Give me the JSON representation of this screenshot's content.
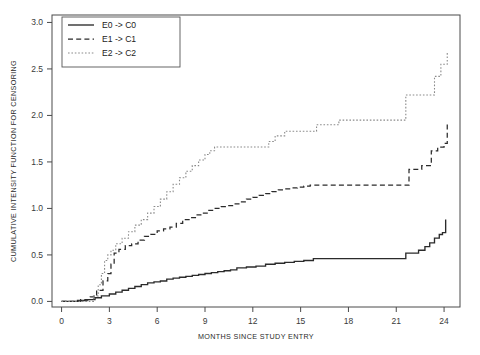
{
  "chart_data": {
    "type": "line",
    "subtype": "step-function",
    "title": "",
    "xlabel": "MONTHS SINCE STUDY ENTRY",
    "ylabel": "CUMULATIVE INTENSITY FUNCTION FOR CENSORING",
    "xlim": [
      -0.6,
      25.0
    ],
    "ylim": [
      -0.06,
      3.08
    ],
    "xticks": [
      0,
      3,
      6,
      9,
      12,
      15,
      18,
      21,
      24
    ],
    "xticklabels": [
      "0",
      "3",
      "6",
      "9",
      "12",
      "15",
      "18",
      "21",
      "24"
    ],
    "yticks": [
      0.0,
      0.5,
      1.0,
      1.5,
      2.0,
      2.5,
      3.0
    ],
    "yticklabels": [
      "0.0",
      "0.5",
      "1.0",
      "1.5",
      "2.0",
      "2.5",
      "3.0"
    ],
    "grid": false,
    "legend_position": "top-left",
    "box_frame": true,
    "series": [
      {
        "name": "E0 -> C0",
        "style": "solid",
        "color": "#2b2b2b",
        "x": [
          0.0,
          1.0,
          1.6,
          2.1,
          2.5,
          3.0,
          3.4,
          3.8,
          4.2,
          4.6,
          5.0,
          5.4,
          5.8,
          6.2,
          6.6,
          7.0,
          7.4,
          7.8,
          8.2,
          8.6,
          9.0,
          9.4,
          9.8,
          10.2,
          10.6,
          11.0,
          11.6,
          12.2,
          12.8,
          13.4,
          14.0,
          14.6,
          15.2,
          15.8,
          16.0,
          17.0,
          18.0,
          19.0,
          20.0,
          21.0,
          21.6,
          22.0,
          22.4,
          22.8,
          23.1,
          23.4,
          23.7,
          23.9,
          24.1
        ],
        "y": [
          0.0,
          0.01,
          0.02,
          0.04,
          0.06,
          0.08,
          0.1,
          0.12,
          0.14,
          0.16,
          0.18,
          0.2,
          0.21,
          0.22,
          0.24,
          0.25,
          0.26,
          0.27,
          0.28,
          0.29,
          0.3,
          0.31,
          0.32,
          0.33,
          0.34,
          0.36,
          0.37,
          0.38,
          0.4,
          0.41,
          0.42,
          0.43,
          0.44,
          0.46,
          0.46,
          0.46,
          0.46,
          0.46,
          0.46,
          0.46,
          0.52,
          0.52,
          0.55,
          0.59,
          0.63,
          0.68,
          0.72,
          0.74,
          0.88
        ]
      },
      {
        "name": "E1 -> C1",
        "style": "dashed",
        "color": "#2b2b2b",
        "x": [
          0.0,
          1.2,
          1.8,
          2.2,
          2.6,
          2.9,
          3.1,
          3.3,
          3.6,
          4.0,
          4.4,
          4.8,
          5.2,
          5.6,
          6.0,
          6.4,
          6.8,
          7.2,
          7.6,
          8.0,
          8.4,
          8.8,
          9.2,
          9.6,
          10.0,
          10.4,
          10.8,
          11.2,
          11.6,
          12.0,
          12.4,
          12.8,
          13.2,
          13.6,
          14.0,
          14.4,
          14.8,
          15.2,
          15.6,
          16.0,
          21.4,
          21.8,
          22.6,
          23.2,
          23.6,
          24.0,
          24.2
        ],
        "y": [
          0.0,
          0.02,
          0.05,
          0.12,
          0.22,
          0.3,
          0.4,
          0.52,
          0.56,
          0.6,
          0.62,
          0.66,
          0.7,
          0.72,
          0.76,
          0.78,
          0.8,
          0.84,
          0.88,
          0.9,
          0.93,
          0.95,
          0.98,
          1.0,
          1.02,
          1.03,
          1.05,
          1.07,
          1.1,
          1.12,
          1.14,
          1.16,
          1.18,
          1.2,
          1.21,
          1.22,
          1.23,
          1.24,
          1.25,
          1.25,
          1.25,
          1.42,
          1.46,
          1.62,
          1.66,
          1.7,
          1.91
        ]
      },
      {
        "name": "E2 -> C2",
        "style": "dotted",
        "color": "#8a8a8a",
        "x": [
          0.0,
          1.8,
          2.0,
          2.3,
          2.5,
          2.7,
          2.9,
          3.1,
          3.4,
          3.8,
          4.2,
          4.6,
          5.0,
          5.4,
          5.8,
          6.2,
          6.6,
          7.0,
          7.4,
          7.8,
          8.2,
          8.6,
          9.0,
          9.3,
          9.6,
          10.0,
          12.6,
          13.0,
          13.4,
          14.0,
          15.6,
          16.0,
          17.4,
          17.8,
          21.2,
          21.6,
          23.0,
          23.4,
          23.8,
          24.2
        ],
        "y": [
          0.0,
          0.0,
          0.06,
          0.18,
          0.3,
          0.44,
          0.5,
          0.55,
          0.62,
          0.68,
          0.75,
          0.82,
          0.88,
          0.95,
          1.02,
          1.1,
          1.18,
          1.26,
          1.33,
          1.4,
          1.46,
          1.52,
          1.58,
          1.62,
          1.66,
          1.66,
          1.66,
          1.72,
          1.78,
          1.83,
          1.83,
          1.9,
          1.95,
          1.95,
          1.95,
          2.22,
          2.22,
          2.42,
          2.55,
          2.68
        ]
      }
    ]
  },
  "legend": {
    "entries": [
      {
        "label": "E0 -> C0",
        "style": "solid"
      },
      {
        "label": "E1 -> C1",
        "style": "dashed"
      },
      {
        "label": "E2 -> C2",
        "style": "dotted"
      }
    ]
  }
}
